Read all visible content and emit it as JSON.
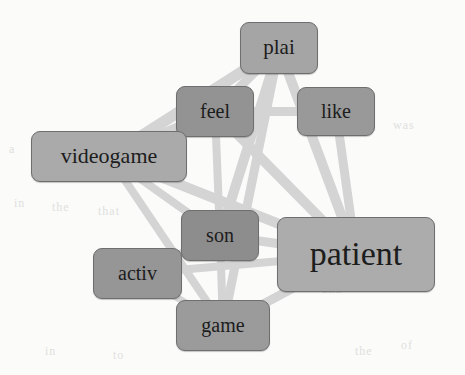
{
  "chart_data": {
    "type": "diagram",
    "subtype": "word-cooccurrence-network",
    "title": "",
    "background_color": "#fdfdfc",
    "edge_color": "#d6d6d6",
    "node_border_color": "#6f6f6f",
    "nodes": [
      {
        "id": "plai",
        "label": "plai",
        "x": 240,
        "y": 22,
        "w": 78,
        "h": 52,
        "font_size": 21,
        "fill": "#a6a6a6"
      },
      {
        "id": "feel",
        "label": "feel",
        "x": 176,
        "y": 86,
        "w": 78,
        "h": 51,
        "font_size": 20,
        "fill": "#949494"
      },
      {
        "id": "like",
        "label": "like",
        "x": 297,
        "y": 87,
        "w": 78,
        "h": 49,
        "font_size": 20,
        "fill": "#9a9a9a"
      },
      {
        "id": "videogame",
        "label": "videogame",
        "x": 31,
        "y": 131,
        "w": 156,
        "h": 51,
        "font_size": 22,
        "fill": "#ababab"
      },
      {
        "id": "son",
        "label": "son",
        "x": 181,
        "y": 210,
        "w": 78,
        "h": 51,
        "font_size": 20,
        "fill": "#8e8e8e"
      },
      {
        "id": "patient",
        "label": "patient",
        "x": 277,
        "y": 217,
        "w": 158,
        "h": 75,
        "font_size": 34,
        "fill": "#adadad"
      },
      {
        "id": "activ",
        "label": "activ",
        "x": 93,
        "y": 248,
        "w": 89,
        "h": 51,
        "font_size": 20,
        "fill": "#979797"
      },
      {
        "id": "game",
        "label": "game",
        "x": 176,
        "y": 300,
        "w": 94,
        "h": 51,
        "font_size": 20,
        "fill": "#9c9c9c"
      }
    ],
    "edges": [
      {
        "source": "videogame",
        "target": "plai",
        "width": 11
      },
      {
        "source": "videogame",
        "target": "feel",
        "width": 10
      },
      {
        "source": "videogame",
        "target": "patient",
        "width": 10
      },
      {
        "source": "videogame",
        "target": "son",
        "width": 8
      },
      {
        "source": "videogame",
        "target": "game",
        "width": 8
      },
      {
        "source": "plai",
        "target": "feel",
        "width": 9
      },
      {
        "source": "plai",
        "target": "son",
        "width": 10
      },
      {
        "source": "plai",
        "target": "patient",
        "width": 10
      },
      {
        "source": "plai",
        "target": "game",
        "width": 9
      },
      {
        "source": "feel",
        "target": "like",
        "width": 9
      },
      {
        "source": "feel",
        "target": "patient",
        "width": 10
      },
      {
        "source": "feel",
        "target": "son",
        "width": 8
      },
      {
        "source": "like",
        "target": "patient",
        "width": 9
      },
      {
        "source": "son",
        "target": "patient",
        "width": 9
      },
      {
        "source": "son",
        "target": "activ",
        "width": 8
      },
      {
        "source": "son",
        "target": "game",
        "width": 8
      },
      {
        "source": "game",
        "target": "patient",
        "width": 9
      },
      {
        "source": "activ",
        "target": "patient",
        "width": 8
      },
      {
        "source": "activ",
        "target": "game",
        "width": 7
      }
    ]
  },
  "artifacts": [
    {
      "text": "in",
      "x": 14,
      "y": 196,
      "size": 12
    },
    {
      "text": "the",
      "x": 52,
      "y": 200,
      "size": 12
    },
    {
      "text": "was",
      "x": 393,
      "y": 118,
      "size": 12
    },
    {
      "text": "that",
      "x": 98,
      "y": 204,
      "size": 12
    },
    {
      "text": "a",
      "x": 9,
      "y": 142,
      "size": 12
    },
    {
      "text": "in",
      "x": 45,
      "y": 344,
      "size": 12
    },
    {
      "text": "to",
      "x": 113,
      "y": 348,
      "size": 12
    },
    {
      "text": "and",
      "x": 322,
      "y": 282,
      "size": 12
    },
    {
      "text": "of",
      "x": 401,
      "y": 338,
      "size": 12
    },
    {
      "text": "the",
      "x": 355,
      "y": 344,
      "size": 12
    }
  ]
}
